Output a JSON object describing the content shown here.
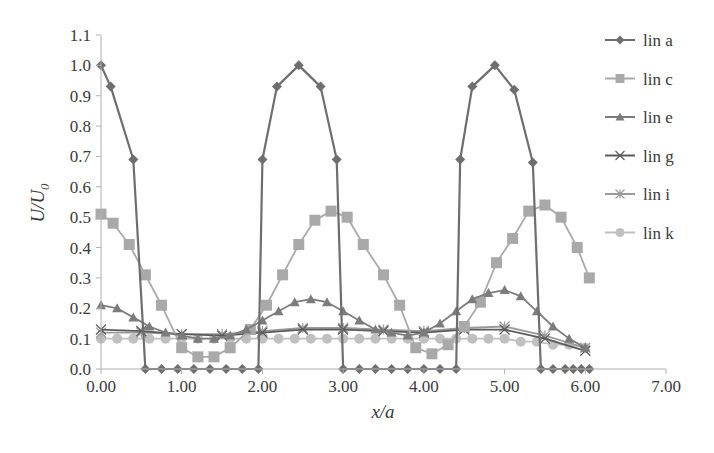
{
  "chart_data": {
    "type": "line",
    "title": "",
    "xlabel": "x/a",
    "ylabel": "U/U0",
    "xlim": [
      0,
      7
    ],
    "ylim": [
      0,
      1.1
    ],
    "x_ticks": [
      "0.00",
      "1.00",
      "2.00",
      "3.00",
      "4.00",
      "5.00",
      "6.00",
      "7.00"
    ],
    "y_ticks": [
      "0.0",
      "0.1",
      "0.2",
      "0.3",
      "0.4",
      "0.5",
      "0.6",
      "0.7",
      "0.8",
      "0.9",
      "1.0",
      "1.1"
    ],
    "grid": false,
    "legend_position": "right",
    "x": [
      0.0,
      0.25,
      0.5,
      0.75,
      1.0,
      1.25,
      1.5,
      1.75,
      2.0,
      2.25,
      2.5,
      2.75,
      3.0,
      3.25,
      3.5,
      3.75,
      4.0,
      4.25,
      4.5,
      4.75,
      5.0,
      5.25,
      5.5,
      5.75,
      6.0
    ],
    "series": [
      {
        "name": "lin a",
        "color": "#6e6e6e",
        "marker": "diamond",
        "x": [
          0.0,
          0.12,
          0.4,
          0.55,
          0.75,
          0.95,
          1.15,
          1.35,
          1.55,
          1.75,
          1.95,
          2.0,
          2.18,
          2.45,
          2.72,
          2.92,
          3.0,
          3.2,
          3.4,
          3.6,
          3.8,
          4.0,
          4.2,
          4.4,
          4.45,
          4.6,
          4.88,
          5.12,
          5.35,
          5.45,
          5.6,
          5.75,
          5.85,
          5.95,
          6.05
        ],
        "values": [
          1.0,
          0.93,
          0.69,
          0.0,
          0.0,
          0.0,
          0.0,
          0.0,
          0.0,
          0.0,
          0.0,
          0.69,
          0.93,
          1.0,
          0.93,
          0.69,
          0.0,
          0.0,
          0.0,
          0.0,
          0.0,
          0.0,
          0.0,
          0.0,
          0.69,
          0.93,
          1.0,
          0.92,
          0.68,
          0.0,
          0.0,
          0.0,
          0.0,
          0.0,
          0.0
        ]
      },
      {
        "name": "lin c",
        "color": "#a9a9a9",
        "marker": "square",
        "x": [
          0.0,
          0.15,
          0.35,
          0.55,
          0.75,
          1.0,
          1.2,
          1.4,
          1.6,
          1.85,
          2.05,
          2.25,
          2.45,
          2.65,
          2.85,
          3.05,
          3.25,
          3.5,
          3.7,
          3.9,
          4.1,
          4.3,
          4.5,
          4.7,
          4.9,
          5.1,
          5.3,
          5.5,
          5.7,
          5.9,
          6.05
        ],
        "values": [
          0.51,
          0.48,
          0.41,
          0.31,
          0.21,
          0.07,
          0.04,
          0.04,
          0.07,
          0.13,
          0.21,
          0.31,
          0.41,
          0.49,
          0.52,
          0.5,
          0.41,
          0.31,
          0.21,
          0.07,
          0.05,
          0.08,
          0.14,
          0.22,
          0.35,
          0.43,
          0.52,
          0.54,
          0.5,
          0.4,
          0.3
        ]
      },
      {
        "name": "lin e",
        "color": "#7c7c7c",
        "marker": "triangle",
        "x": [
          0.0,
          0.2,
          0.4,
          0.6,
          0.8,
          1.0,
          1.2,
          1.4,
          1.6,
          1.8,
          2.0,
          2.2,
          2.4,
          2.6,
          2.8,
          3.0,
          3.2,
          3.4,
          3.6,
          3.8,
          4.0,
          4.2,
          4.4,
          4.6,
          4.8,
          5.0,
          5.2,
          5.4,
          5.6,
          5.8,
          6.0
        ],
        "values": [
          0.21,
          0.2,
          0.17,
          0.14,
          0.12,
          0.11,
          0.1,
          0.1,
          0.11,
          0.13,
          0.16,
          0.19,
          0.22,
          0.23,
          0.22,
          0.19,
          0.16,
          0.13,
          0.12,
          0.11,
          0.12,
          0.15,
          0.19,
          0.23,
          0.25,
          0.26,
          0.24,
          0.19,
          0.14,
          0.1,
          0.07
        ]
      },
      {
        "name": "lin g",
        "color": "#5a5a5a",
        "marker": "x",
        "x": [
          0.0,
          0.5,
          1.0,
          1.5,
          2.0,
          2.5,
          3.0,
          3.5,
          4.0,
          4.5,
          5.0,
          5.5,
          6.0
        ],
        "values": [
          0.13,
          0.125,
          0.115,
          0.11,
          0.12,
          0.13,
          0.13,
          0.125,
          0.12,
          0.13,
          0.13,
          0.1,
          0.06
        ]
      },
      {
        "name": "lin i",
        "color": "#9a9a9a",
        "marker": "star",
        "x": [
          0.0,
          0.5,
          1.0,
          1.5,
          2.0,
          2.5,
          3.0,
          3.5,
          4.0,
          4.5,
          5.0,
          5.5,
          6.0
        ],
        "values": [
          0.12,
          0.12,
          0.115,
          0.115,
          0.125,
          0.135,
          0.135,
          0.13,
          0.125,
          0.135,
          0.14,
          0.11,
          0.07
        ]
      },
      {
        "name": "lin k",
        "color": "#c0c0c0",
        "marker": "circle",
        "x": [
          0.0,
          0.2,
          0.4,
          0.6,
          0.8,
          1.0,
          1.2,
          1.4,
          1.6,
          1.8,
          2.0,
          2.2,
          2.4,
          2.6,
          2.8,
          3.0,
          3.2,
          3.4,
          3.6,
          3.8,
          4.0,
          4.2,
          4.4,
          4.6,
          4.8,
          5.0,
          5.2,
          5.4,
          5.6,
          5.8,
          6.0
        ],
        "values": [
          0.1,
          0.1,
          0.1,
          0.1,
          0.1,
          0.1,
          0.1,
          0.1,
          0.1,
          0.1,
          0.1,
          0.1,
          0.1,
          0.1,
          0.1,
          0.1,
          0.1,
          0.1,
          0.1,
          0.1,
          0.1,
          0.1,
          0.1,
          0.1,
          0.1,
          0.1,
          0.09,
          0.09,
          0.08,
          0.08,
          0.07
        ]
      }
    ]
  },
  "legend": {
    "items": [
      {
        "label": "lin a"
      },
      {
        "label": "lin c"
      },
      {
        "label": "lin e"
      },
      {
        "label": "lin g"
      },
      {
        "label": "lin i"
      },
      {
        "label": "lin k"
      }
    ]
  },
  "axes": {
    "xlabel": "x/a",
    "ylabel_main": "U/U",
    "ylabel_sub": "0"
  },
  "colors": {
    "axis": "#b0b0b0",
    "text": "#3a3a3a"
  }
}
